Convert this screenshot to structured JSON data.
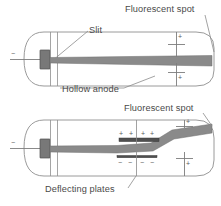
{
  "figure": {
    "colors": {
      "beam": "#8a8a8a",
      "beam_edge": "#6e6e6e",
      "cathode": "#707070",
      "plate": "#4a4a4a",
      "outline": "#8e8e8e",
      "text": "#4a4a4a",
      "background": "#ffffff"
    },
    "panels": [
      {
        "name": "undeflected-tube",
        "description": "Cathode ray tube with straight undeflected beam striking the far right end",
        "beam_path": "straight",
        "cathode_sign": "−",
        "anode_signs": [
          "+",
          "+"
        ],
        "labels": [
          "Fluorescent spot",
          "Slit",
          "Hollow anode"
        ]
      },
      {
        "name": "deflected-tube",
        "description": "Cathode ray tube with beam deflected upward between charged deflecting plates",
        "beam_path": "deflected-upward",
        "cathode_sign": "−",
        "anode_signs": [
          "+",
          "+"
        ],
        "upper_plate_charges": [
          "+",
          "+",
          "+",
          "+"
        ],
        "lower_plate_charges": [
          "−",
          "−",
          "−",
          "−"
        ],
        "labels": [
          "Fluorescent spot",
          "Deflecting plates"
        ]
      }
    ]
  },
  "labels": {
    "fluorescent_spot_top": "Fluorescent spot",
    "slit": "Slit",
    "hollow_anode": "Hollow anode",
    "fluorescent_spot_bottom": "Fluorescent spot",
    "deflecting_plates": "Deflecting plates"
  },
  "signs": {
    "minus": "−",
    "plus": "+"
  }
}
